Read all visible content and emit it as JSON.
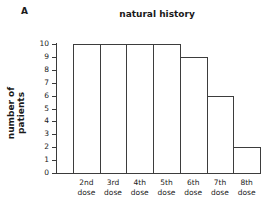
{
  "panel": {
    "label": "A"
  },
  "chart_data": {
    "type": "bar",
    "title": "natural history",
    "xlabel": "",
    "ylabel": "number of patients",
    "categories": [
      "2nd dose",
      "3rd dose",
      "4th dose",
      "5th dose",
      "6th dose",
      "7th dose",
      "8th dose"
    ],
    "category_lines": [
      {
        "ordinal": "2nd",
        "unit": "dose"
      },
      {
        "ordinal": "3rd",
        "unit": "dose"
      },
      {
        "ordinal": "4th",
        "unit": "dose"
      },
      {
        "ordinal": "5th",
        "unit": "dose"
      },
      {
        "ordinal": "6th",
        "unit": "dose"
      },
      {
        "ordinal": "7th",
        "unit": "dose"
      },
      {
        "ordinal": "8th",
        "unit": "dose"
      }
    ],
    "values": [
      10,
      10,
      10,
      10,
      9,
      6,
      2
    ],
    "ylim": [
      0,
      10
    ],
    "ytick_labels": [
      "10",
      "9",
      "8",
      "7",
      "6",
      "5",
      "4",
      "3",
      "2",
      "1",
      "0"
    ],
    "ytick_values": [
      10,
      9,
      8,
      7,
      6,
      5,
      4,
      3,
      2,
      1,
      0
    ],
    "grid": false,
    "legend": "none",
    "bar_style": {
      "fill": "#ffffff",
      "stroke": "#3d3d3d",
      "gap": 0
    },
    "axis_color": "#3a3a3a",
    "text_color": "#1a1a1a"
  }
}
